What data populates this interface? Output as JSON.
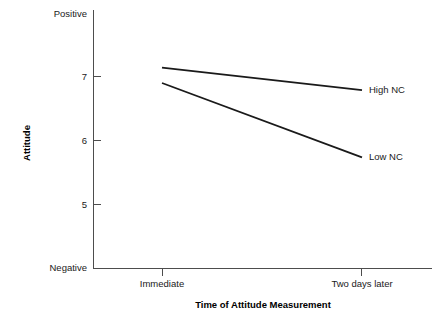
{
  "chart_data": {
    "type": "line",
    "title": "",
    "xlabel": "Time of Attitude Measurement",
    "ylabel": "Attitude",
    "categories": [
      "Immediate",
      "Two days later"
    ],
    "x": [
      0,
      1
    ],
    "ylim": [
      4.0,
      8.0
    ],
    "yticks": [
      5,
      6,
      7
    ],
    "ytick_labels": [
      "5",
      "6",
      "7"
    ],
    "y_endpoint_low_label": "Negative",
    "y_endpoint_high_label": "Positive",
    "grid": false,
    "legend_position": "right-inline",
    "series": [
      {
        "name": "High NC",
        "values": [
          7.13,
          6.78
        ],
        "color": "#1a1a1a"
      },
      {
        "name": "Low NC",
        "values": [
          6.89,
          5.73
        ],
        "color": "#1a1a1a"
      }
    ],
    "annotations": [
      {
        "text": "High NC",
        "x": 1,
        "y": 6.78
      },
      {
        "text": "Low NC",
        "x": 1,
        "y": 5.73
      }
    ]
  },
  "axis": {
    "y_title": "Attitude",
    "x_title": "Time of Attitude Measurement",
    "y_top_label": "Positive",
    "y_bottom_label": "Negative",
    "y_tick_7": "7",
    "y_tick_6": "6",
    "y_tick_5": "5",
    "x_cat_1": "Immediate",
    "x_cat_2": "Two days later"
  },
  "series_labels": {
    "high": "High NC",
    "low": "Low NC"
  },
  "colors": {
    "line": "#1a1a1a",
    "axis": "#4d4d4d",
    "text": "#1a1a1a",
    "background": "#ffffff"
  }
}
